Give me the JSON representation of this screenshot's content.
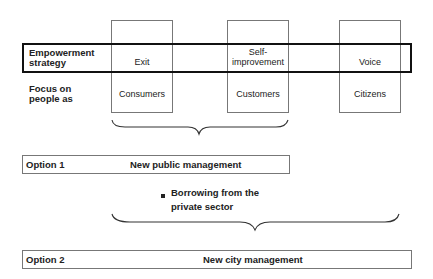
{
  "rows": {
    "strategy_label": "Empowerment strategy",
    "focus_label": "Focus on people as"
  },
  "columns": [
    {
      "strategy": "Exit",
      "focus": "Consumers"
    },
    {
      "strategy": "Self-improvement",
      "strategy_line1": "Self-",
      "strategy_line2": "improvement",
      "focus": "Customers"
    },
    {
      "strategy": "Voice",
      "focus": "Citizens"
    }
  ],
  "option1": {
    "label": "Option 1",
    "title": "New public management"
  },
  "bullet": {
    "line1": "Borrowing from the",
    "line2": "private sector"
  },
  "option2": {
    "label": "Option 2",
    "title": "New city management"
  }
}
